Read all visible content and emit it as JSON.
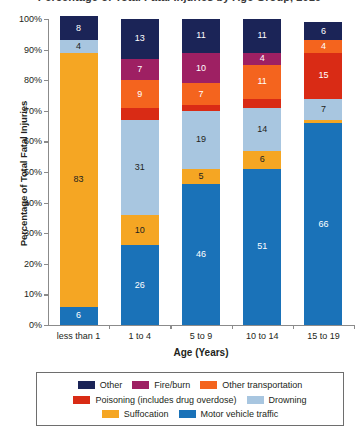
{
  "chart_data": {
    "type": "bar",
    "subtype": "stacked-percentage",
    "title": "Percentage of Total Fatal Injuries by Age Group, 2019",
    "xlabel": "Age (Years)",
    "ylabel": "Percentage of Total Fatal Injuries",
    "ylim": [
      0,
      100
    ],
    "ytick_labels": [
      "0%",
      "10%",
      "20%",
      "30%",
      "40%",
      "50%",
      "60%",
      "70%",
      "80%",
      "90%",
      "100%"
    ],
    "ytick_values": [
      0,
      10,
      20,
      30,
      40,
      50,
      60,
      70,
      80,
      90,
      100
    ],
    "grid": false,
    "legend_position": "bottom",
    "categories": [
      "less than 1",
      "1 to 4",
      "5 to 9",
      "10 to 14",
      "15 to 19"
    ],
    "series": [
      {
        "name": "Motor vehicle traffic",
        "color": "#1a72b8",
        "label_color": "#ffffff",
        "values": [
          6,
          26,
          46,
          51,
          66
        ],
        "labels": [
          "6",
          "26",
          "46",
          "51",
          "66"
        ]
      },
      {
        "name": "Suffocation",
        "color": "#f5a623",
        "label_color": "#231f20",
        "values": [
          83,
          10,
          5,
          6,
          1
        ],
        "labels": [
          "83",
          "10",
          "5",
          "6",
          ""
        ]
      },
      {
        "name": "Drowning",
        "color": "#a8c6e0",
        "label_color": "#231f20",
        "values": [
          4,
          31,
          19,
          14,
          7
        ],
        "labels": [
          "4",
          "31",
          "19",
          "14",
          "7"
        ]
      },
      {
        "name": "Poisoning (includes drug overdose)",
        "color": "#d92b15",
        "label_color": "#ffffff",
        "values": [
          0,
          4,
          2,
          3,
          15
        ],
        "labels": [
          "",
          "",
          "",
          "",
          "15"
        ]
      },
      {
        "name": "Other transportation",
        "color": "#f4641e",
        "label_color": "#ffffff",
        "values": [
          0,
          9,
          7,
          11,
          4
        ],
        "labels": [
          "",
          "9",
          "7",
          "11",
          "4"
        ]
      },
      {
        "name": "Fire/burn",
        "color": "#9e2063",
        "label_color": "#ffffff",
        "values": [
          0,
          7,
          10,
          4,
          0
        ],
        "labels": [
          "",
          "7",
          "10",
          "4",
          ""
        ]
      },
      {
        "name": "Other",
        "color": "#1b2457",
        "label_color": "#ffffff",
        "values": [
          8,
          13,
          11,
          11,
          6
        ],
        "labels": [
          "8",
          "13",
          "11",
          "11",
          "6"
        ]
      }
    ]
  },
  "legend": {
    "rows": [
      [
        {
          "name": "Other",
          "color": "#1b2457"
        },
        {
          "name": "Fire/burn",
          "color": "#9e2063"
        },
        {
          "name": "Other transportation",
          "color": "#f4641e"
        }
      ],
      [
        {
          "name": "Poisoning (includes drug overdose)",
          "color": "#d92b15"
        },
        {
          "name": "Drowning",
          "color": "#a8c6e0"
        }
      ],
      [
        {
          "name": "Suffocation",
          "color": "#f5a623"
        },
        {
          "name": "Motor vehicle traffic",
          "color": "#1a72b8"
        }
      ]
    ]
  }
}
